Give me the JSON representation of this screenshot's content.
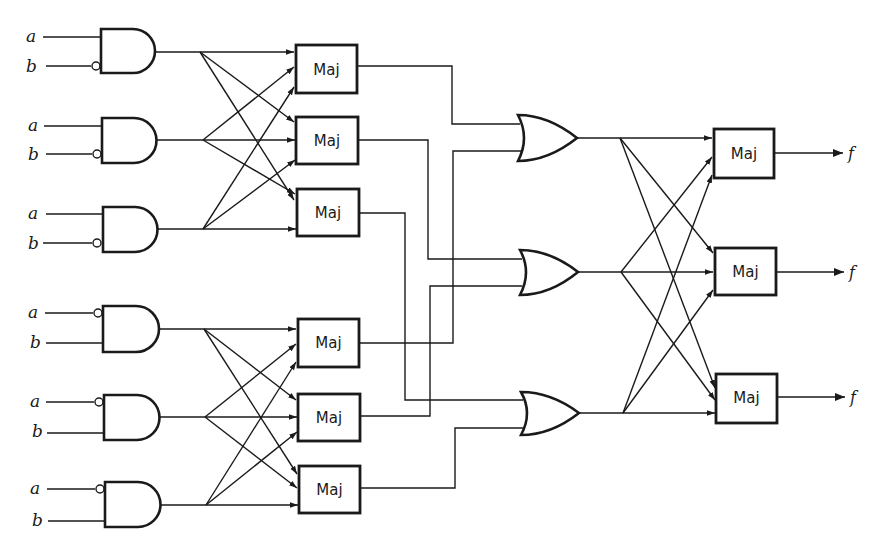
{
  "diagram": {
    "type": "logic-circuit",
    "colors": {
      "line": "#1a1a1a",
      "background": "#ffffff"
    },
    "and_gates": [
      {
        "id": "and1",
        "inputs": [
          {
            "label": "a",
            "inverted": false
          },
          {
            "label": "b",
            "inverted": true
          }
        ]
      },
      {
        "id": "and2",
        "inputs": [
          {
            "label": "a",
            "inverted": false
          },
          {
            "label": "b",
            "inverted": true
          }
        ]
      },
      {
        "id": "and3",
        "inputs": [
          {
            "label": "a",
            "inverted": false
          },
          {
            "label": "b",
            "inverted": true
          }
        ]
      },
      {
        "id": "and4",
        "inputs": [
          {
            "label": "a",
            "inverted": true
          },
          {
            "label": "b",
            "inverted": false
          }
        ]
      },
      {
        "id": "and5",
        "inputs": [
          {
            "label": "a",
            "inverted": true
          },
          {
            "label": "b",
            "inverted": false
          }
        ]
      },
      {
        "id": "and6",
        "inputs": [
          {
            "label": "a",
            "inverted": true
          },
          {
            "label": "b",
            "inverted": false
          }
        ]
      }
    ],
    "maj_stage1": [
      {
        "id": "maj1",
        "label": "Maj"
      },
      {
        "id": "maj2",
        "label": "Maj"
      },
      {
        "id": "maj3",
        "label": "Maj"
      },
      {
        "id": "maj4",
        "label": "Maj"
      },
      {
        "id": "maj5",
        "label": "Maj"
      },
      {
        "id": "maj6",
        "label": "Maj"
      }
    ],
    "or_gates": [
      {
        "id": "or1",
        "inputs": [
          "maj1",
          "maj4"
        ]
      },
      {
        "id": "or2",
        "inputs": [
          "maj2",
          "maj5"
        ]
      },
      {
        "id": "or3",
        "inputs": [
          "maj3",
          "maj6"
        ]
      }
    ],
    "maj_stage2": [
      {
        "id": "majf1",
        "label": "Maj",
        "output": "f"
      },
      {
        "id": "majf2",
        "label": "Maj",
        "output": "f"
      },
      {
        "id": "majf3",
        "label": "Maj",
        "output": "f"
      }
    ]
  }
}
